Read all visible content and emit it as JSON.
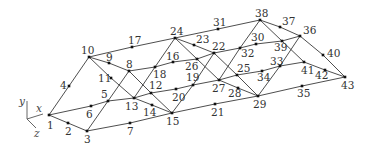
{
  "diagram": {
    "title": "",
    "type": "space truss (numbered nodes)",
    "axes": {
      "origin": [
        27,
        119
      ],
      "labels": [
        {
          "name": "y",
          "end": [
            27,
            101
          ],
          "label_pos": [
            19,
            105
          ]
        },
        {
          "name": "x",
          "end": [
            43,
            114
          ],
          "label_pos": [
            36,
            112
          ]
        },
        {
          "name": "z",
          "end": [
            36,
            128
          ],
          "label_pos": [
            34,
            137
          ]
        }
      ]
    },
    "nodes": [
      {
        "id": "1",
        "x": 49,
        "y": 115,
        "lx": 47,
        "ly": 129
      },
      {
        "id": "2",
        "x": 68,
        "y": 123,
        "lx": 65,
        "ly": 135
      },
      {
        "id": "3",
        "x": 87,
        "y": 131,
        "lx": 84,
        "ly": 143
      },
      {
        "id": "4",
        "x": 69,
        "y": 86,
        "lx": 60,
        "ly": 89
      },
      {
        "id": "5",
        "x": 108,
        "y": 101,
        "lx": 101,
        "ly": 98
      },
      {
        "id": "6",
        "x": 91,
        "y": 106,
        "lx": 86,
        "ly": 118
      },
      {
        "id": "7",
        "x": 130,
        "y": 123,
        "lx": 127,
        "ly": 135
      },
      {
        "id": "8",
        "x": 129,
        "y": 71,
        "lx": 126,
        "ly": 68
      },
      {
        "id": "9",
        "x": 109,
        "y": 63,
        "lx": 106,
        "ly": 61
      },
      {
        "id": "10",
        "x": 89,
        "y": 57,
        "lx": 81,
        "ly": 54
      },
      {
        "id": "11",
        "x": 111,
        "y": 78,
        "lx": 98,
        "ly": 82
      },
      {
        "id": "12",
        "x": 151,
        "y": 93,
        "lx": 149,
        "ly": 89
      },
      {
        "id": "13",
        "x": 134,
        "y": 98,
        "lx": 125,
        "ly": 110
      },
      {
        "id": "14",
        "x": 152,
        "y": 105,
        "lx": 143,
        "ly": 116
      },
      {
        "id": "15",
        "x": 172,
        "y": 113,
        "lx": 166,
        "ly": 125
      },
      {
        "id": "16",
        "x": 173,
        "y": 62,
        "lx": 166,
        "ly": 60
      },
      {
        "id": "17",
        "x": 132,
        "y": 47,
        "lx": 128,
        "ly": 44
      },
      {
        "id": "18",
        "x": 155,
        "y": 67,
        "lx": 153,
        "ly": 78
      },
      {
        "id": "19",
        "x": 193,
        "y": 85,
        "lx": 186,
        "ly": 81
      },
      {
        "id": "20",
        "x": 176,
        "y": 89,
        "lx": 172,
        "ly": 101
      },
      {
        "id": "21",
        "x": 215,
        "y": 104,
        "lx": 211,
        "ly": 116
      },
      {
        "id": "22",
        "x": 214,
        "y": 53,
        "lx": 212,
        "ly": 50
      },
      {
        "id": "23",
        "x": 194,
        "y": 45,
        "lx": 196,
        "ly": 43
      },
      {
        "id": "24",
        "x": 175,
        "y": 38,
        "lx": 170,
        "ly": 35
      },
      {
        "id": "25",
        "x": 237,
        "y": 75,
        "lx": 237,
        "ly": 72
      },
      {
        "id": "26",
        "x": 197,
        "y": 59,
        "lx": 185,
        "ly": 70
      },
      {
        "id": "27",
        "x": 219,
        "y": 80,
        "lx": 212,
        "ly": 92
      },
      {
        "id": "28",
        "x": 238,
        "y": 88,
        "lx": 228,
        "ly": 97
      },
      {
        "id": "29",
        "x": 258,
        "y": 96,
        "lx": 253,
        "ly": 108
      },
      {
        "id": "30",
        "x": 256,
        "y": 44,
        "lx": 251,
        "ly": 41
      },
      {
        "id": "31",
        "x": 218,
        "y": 29,
        "lx": 213,
        "ly": 26
      },
      {
        "id": "32",
        "x": 240,
        "y": 48,
        "lx": 241,
        "ly": 57
      },
      {
        "id": "33",
        "x": 280,
        "y": 66,
        "lx": 270,
        "ly": 65
      },
      {
        "id": "34",
        "x": 262,
        "y": 71,
        "lx": 257,
        "ly": 81
      },
      {
        "id": "35",
        "x": 302,
        "y": 86,
        "lx": 297,
        "ly": 97
      },
      {
        "id": "36",
        "x": 300,
        "y": 36,
        "lx": 303,
        "ly": 34
      },
      {
        "id": "37",
        "x": 280,
        "y": 27,
        "lx": 282,
        "ly": 25
      },
      {
        "id": "38",
        "x": 260,
        "y": 20,
        "lx": 255,
        "ly": 17
      },
      {
        "id": "39",
        "x": 282,
        "y": 41,
        "lx": 274,
        "ly": 51
      },
      {
        "id": "40",
        "x": 323,
        "y": 55,
        "lx": 327,
        "ly": 57
      },
      {
        "id": "41",
        "x": 304,
        "y": 62,
        "lx": 301,
        "ly": 74
      },
      {
        "id": "42",
        "x": 325,
        "y": 70,
        "lx": 315,
        "ly": 79
      },
      {
        "id": "43",
        "x": 345,
        "y": 77,
        "lx": 341,
        "ly": 89
      }
    ],
    "members": [
      [
        "1",
        "4",
        "10"
      ],
      [
        "1",
        "2",
        "3"
      ],
      [
        "1",
        "6",
        "5",
        "13",
        "12",
        "20",
        "19",
        "27",
        "25",
        "34",
        "33",
        "41"
      ],
      [
        "3",
        "7",
        "15",
        "21",
        "29",
        "35",
        "43"
      ],
      [
        "10",
        "17",
        "24",
        "31",
        "38"
      ],
      [
        "10",
        "9",
        "8",
        "18",
        "16",
        "26",
        "22",
        "32",
        "30",
        "39",
        "36"
      ],
      [
        "3",
        "5",
        "8"
      ],
      [
        "8",
        "12",
        "15"
      ],
      [
        "10",
        "11",
        "13"
      ],
      [
        "13",
        "18",
        "24"
      ],
      [
        "13",
        "14",
        "15"
      ],
      [
        "15",
        "19",
        "22"
      ],
      [
        "24",
        "23",
        "22"
      ],
      [
        "24",
        "26",
        "27"
      ],
      [
        "22",
        "25",
        "29"
      ],
      [
        "27",
        "28",
        "29"
      ],
      [
        "27",
        "32",
        "38"
      ],
      [
        "29",
        "33",
        "36"
      ],
      [
        "38",
        "37",
        "36"
      ],
      [
        "38",
        "39",
        "41"
      ],
      [
        "36",
        "40",
        "43"
      ],
      [
        "41",
        "42",
        "43"
      ]
    ]
  }
}
